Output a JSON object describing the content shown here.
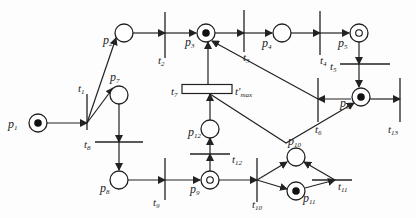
{
  "diagram": {
    "type": "petri-net",
    "places": [
      {
        "id": "p1",
        "label": "p",
        "sub": "1",
        "tokens": "marked"
      },
      {
        "id": "p2",
        "label": "p",
        "sub": "2",
        "tokens": "empty"
      },
      {
        "id": "p3",
        "label": "p",
        "sub": "3",
        "tokens": "marked"
      },
      {
        "id": "p4",
        "label": "p",
        "sub": "4",
        "tokens": "empty"
      },
      {
        "id": "p5",
        "label": "p",
        "sub": "5",
        "tokens": "ring"
      },
      {
        "id": "p6",
        "label": "p",
        "sub": "6",
        "tokens": "marked"
      },
      {
        "id": "p7",
        "label": "p",
        "sub": "7",
        "tokens": "empty"
      },
      {
        "id": "p8",
        "label": "p",
        "sub": "8",
        "tokens": "empty"
      },
      {
        "id": "p9",
        "label": "p",
        "sub": "9",
        "tokens": "ring"
      },
      {
        "id": "p10",
        "label": "p",
        "sub": "10",
        "tokens": "empty"
      },
      {
        "id": "p11",
        "label": "p",
        "sub": "11",
        "tokens": "marked"
      },
      {
        "id": "p12",
        "label": "p",
        "sub": "12",
        "tokens": "empty"
      }
    ],
    "transitions": [
      {
        "id": "t1",
        "label": "t",
        "sub": "1"
      },
      {
        "id": "t2",
        "label": "t",
        "sub": "2"
      },
      {
        "id": "t3",
        "label": "t",
        "sub": "3"
      },
      {
        "id": "t4",
        "label": "t",
        "sub": "4"
      },
      {
        "id": "t5",
        "label": "t",
        "sub": "5"
      },
      {
        "id": "t6",
        "label": "t",
        "sub": "6"
      },
      {
        "id": "t7",
        "label": "t",
        "sub": "7",
        "annotation": "t'",
        "annotation_sub": "max"
      },
      {
        "id": "t8",
        "label": "t",
        "sub": "8"
      },
      {
        "id": "t9",
        "label": "t",
        "sub": "9"
      },
      {
        "id": "t10",
        "label": "t",
        "sub": "10"
      },
      {
        "id": "t11",
        "label": "t",
        "sub": "11"
      },
      {
        "id": "t12",
        "label": "t",
        "sub": "12"
      },
      {
        "id": "t13",
        "label": "t",
        "sub": "13"
      }
    ],
    "arcs": [
      [
        "p1",
        "t1"
      ],
      [
        "t1",
        "p2"
      ],
      [
        "t1",
        "p7"
      ],
      [
        "p2",
        "t2"
      ],
      [
        "t2",
        "p3"
      ],
      [
        "p3",
        "t3"
      ],
      [
        "t3",
        "p4"
      ],
      [
        "p4",
        "t4"
      ],
      [
        "t4",
        "p5"
      ],
      [
        "p5",
        "t5"
      ],
      [
        "t5",
        "p6"
      ],
      [
        "p6",
        "t6"
      ],
      [
        "t6",
        "p3"
      ],
      [
        "p6",
        "t13"
      ],
      [
        "p7",
        "t8"
      ],
      [
        "t8",
        "p8"
      ],
      [
        "p8",
        "t9"
      ],
      [
        "t9",
        "p9"
      ],
      [
        "p9",
        "t12"
      ],
      [
        "t12",
        "p12"
      ],
      [
        "p12",
        "t7"
      ],
      [
        "t7",
        "p3"
      ],
      [
        "p9",
        "t10"
      ],
      [
        "t10",
        "p10"
      ],
      [
        "t10",
        "p11"
      ],
      [
        "p11",
        "t11"
      ],
      [
        "t11",
        "p10"
      ],
      [
        "t7",
        "p6"
      ]
    ],
    "colors": {
      "stroke": "#222222",
      "token": "#111111",
      "background": "#fdfdfd"
    }
  }
}
